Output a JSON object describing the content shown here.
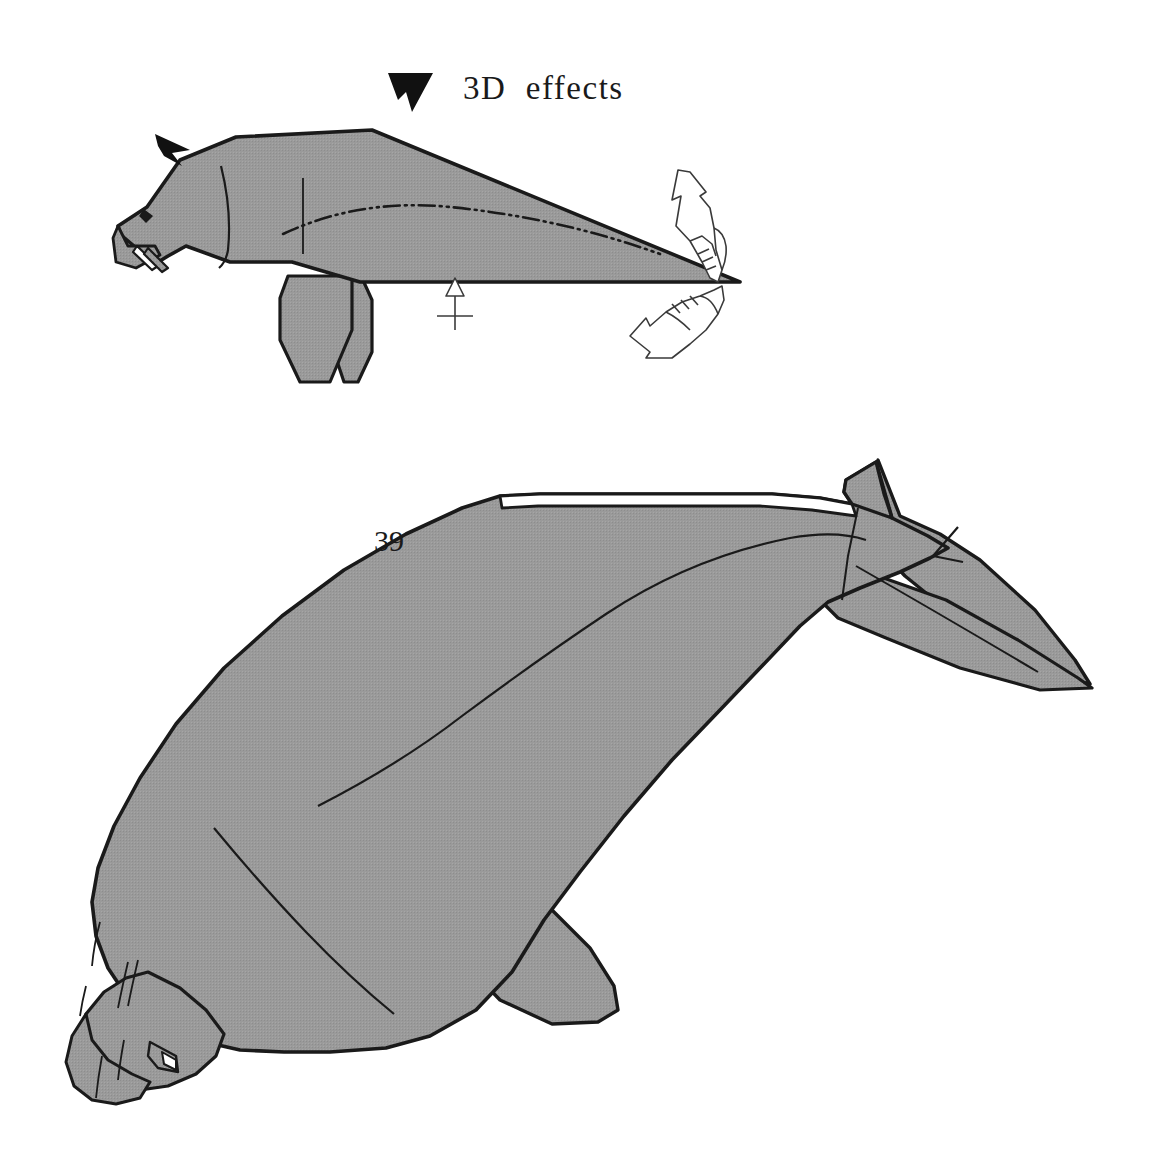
{
  "page": {
    "kind": "origami-instruction-diagram",
    "background_color": "#ffffff",
    "width": 1167,
    "height": 1166
  },
  "annotations": {
    "effects_label": "3D  effects",
    "step_number": "39"
  },
  "palette": {
    "paper_fill": "#999999",
    "paper_fill_shadow": "#8e8e8e",
    "outline": "#1a1a1a",
    "crease_line": "#1a1a1a",
    "arrow_outline": "#333333",
    "solid_arrow": "#111111",
    "text": "#1a1a1a",
    "background": "#ffffff"
  },
  "figures": [
    {
      "id": "figure-step-39-flat",
      "name": "seal-flat-profile",
      "caption": "3D  effects",
      "position": "top",
      "markers": [
        {
          "name": "solid-arrowhead-head",
          "meaning": "attention-at-head",
          "x": 178,
          "y": 148
        },
        {
          "name": "solid-arrowhead-caption",
          "meaning": "attention-at-back",
          "x": 410,
          "y": 90
        },
        {
          "name": "push-arrow-belly",
          "meaning": "press-here",
          "x": 455,
          "y": 280
        },
        {
          "name": "pull-hand-arrow-upper",
          "meaning": "pull-apart-up",
          "x": 690,
          "y": 215
        },
        {
          "name": "pull-hand-arrow-lower",
          "meaning": "pull-apart-down",
          "x": 665,
          "y": 320
        }
      ],
      "fold_lines": [
        {
          "name": "mountain-fold-dashdot-body",
          "style": "dash-dot-dot"
        },
        {
          "name": "valley-crease-vertical-back",
          "style": "solid-thin"
        },
        {
          "name": "crease-neck",
          "style": "solid-thin"
        }
      ]
    },
    {
      "id": "figure-step-39-result",
      "name": "seal-finished-3d",
      "caption": "39",
      "position": "bottom",
      "fold_lines": [
        {
          "name": "body-center-crease",
          "style": "solid-thin"
        },
        {
          "name": "belly-crease",
          "style": "solid-thin"
        },
        {
          "name": "tail-crease",
          "style": "solid-thin"
        },
        {
          "name": "whisker-creases",
          "style": "solid-thin"
        },
        {
          "name": "dorsal-notch",
          "style": "solid-thin"
        }
      ]
    }
  ]
}
